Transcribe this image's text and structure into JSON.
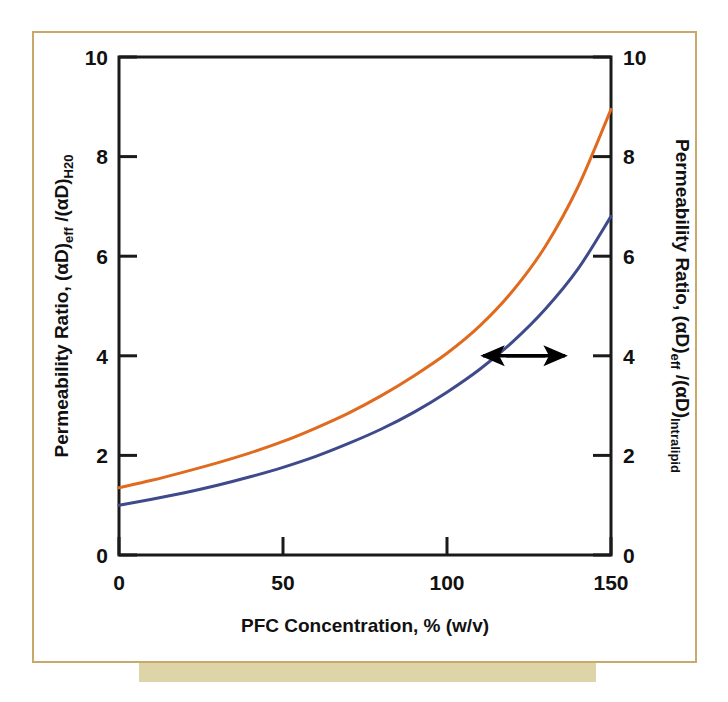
{
  "figure": {
    "frame_color": "#c9a96a",
    "caption_bar_color": "#ddd4a8",
    "background": "#ffffff"
  },
  "chart_data": {
    "type": "line",
    "title": "",
    "subtitle": "",
    "xlabel": "PFC Concentration, % (w/v)",
    "ylabel": "Permeability Ratio, (αD)eff /(αD)H20",
    "ylabel_right": "Permeability Ratio, (αD)eff /(αD)Intralipid",
    "xlim": [
      0,
      150
    ],
    "ylim": [
      0,
      10
    ],
    "ylim_right": [
      0,
      10
    ],
    "xticks": [
      0,
      50,
      100,
      150
    ],
    "yticks": [
      0,
      2,
      4,
      6,
      8,
      10
    ],
    "yticks_right": [
      0,
      2,
      4,
      6,
      8,
      10
    ],
    "xtick_labels": [
      "0",
      "50",
      "100",
      "150"
    ],
    "ytick_labels": [
      "0",
      "2",
      "4",
      "6",
      "8",
      "10"
    ],
    "ytick_labels_right": [
      "0",
      "2",
      "4",
      "6",
      "8",
      "10"
    ],
    "grid": false,
    "legend": "none",
    "x": [
      0,
      10,
      20,
      30,
      40,
      50,
      60,
      70,
      80,
      90,
      100,
      110,
      120,
      130,
      140,
      150
    ],
    "series": [
      {
        "name": "H20 reference (left axis)",
        "color": "#e06a1e",
        "axis": "left",
        "values": [
          1.35,
          1.5,
          1.67,
          1.85,
          2.05,
          2.28,
          2.55,
          2.85,
          3.2,
          3.6,
          4.05,
          4.6,
          5.3,
          6.2,
          7.4,
          8.95
        ]
      },
      {
        "name": "Intralipid reference (right axis)",
        "color": "#3f4a8a",
        "axis": "right",
        "values": [
          1.0,
          1.12,
          1.25,
          1.4,
          1.57,
          1.76,
          1.98,
          2.24,
          2.53,
          2.87,
          3.27,
          3.73,
          4.28,
          4.94,
          5.75,
          6.8
        ]
      }
    ],
    "annotations": [
      {
        "name": "left-axis-arrow",
        "kind": "arrow",
        "direction": "left",
        "x_start": 130,
        "x_end": 111,
        "y": 4.0,
        "color": "#000000"
      },
      {
        "name": "right-axis-arrow",
        "kind": "arrow",
        "direction": "right",
        "x_start": 118,
        "x_end": 136,
        "y": 4.0,
        "color": "#000000"
      }
    ]
  },
  "axis_labels": {
    "left": {
      "part1": "Permeability Ratio, (αD)",
      "sub1": "eff",
      "part2": " /(αD)",
      "sub2": "H20"
    },
    "right": {
      "part1": "Permeability Ratio, (αD)",
      "sub1": "eff",
      "part2": " /(αD)",
      "sub2": "Intralipid"
    },
    "bottom": {
      "text": "PFC Concentration, % (w/v)"
    }
  }
}
